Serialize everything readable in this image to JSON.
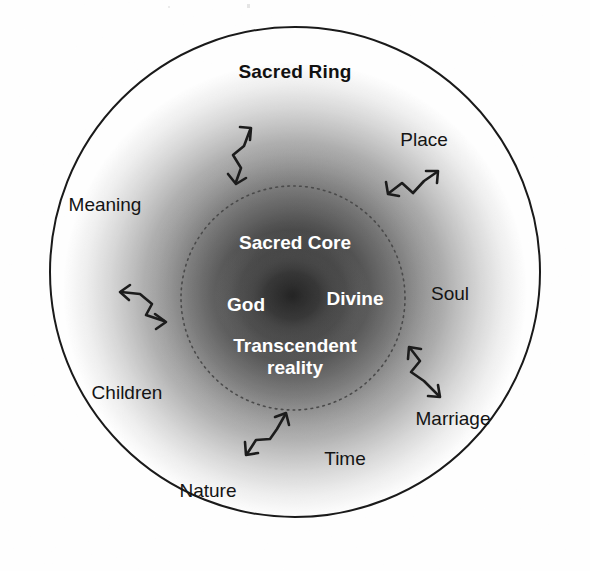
{
  "figure": {
    "type": "concentric-circle-diagram",
    "background_color": "#ffffff",
    "outer_circle": {
      "label": "Sacred Ring",
      "stroke_color": "#1a1a1a",
      "center": [
        295,
        272
      ],
      "radius": 245,
      "style": "solid"
    },
    "inner_circle": {
      "label": "Sacred Core",
      "stroke_color": "#555555",
      "center": [
        293,
        298
      ],
      "radius": 112,
      "style": "dotted"
    },
    "gradient": {
      "description": "radial dark-to-light halo",
      "center_color": "#101010",
      "edge_color": "#ffffff"
    }
  },
  "core": {
    "title": "Sacred Core",
    "terms": [
      {
        "text": "God",
        "x": 246,
        "y": 305
      },
      {
        "text": "Divine",
        "x": 355,
        "y": 299
      },
      {
        "text": "Transcendent",
        "x": 295,
        "y": 346
      },
      {
        "text": "reality",
        "x": 295,
        "y": 368
      }
    ]
  },
  "ring": {
    "title": "Sacred Ring",
    "title_x": 295,
    "title_y": 72,
    "labels": [
      {
        "text": "Place",
        "x": 424,
        "y": 140
      },
      {
        "text": "Meaning",
        "x": 105,
        "y": 205
      },
      {
        "text": "Soul",
        "x": 450,
        "y": 294
      },
      {
        "text": "Children",
        "x": 127,
        "y": 393
      },
      {
        "text": "Marriage",
        "x": 453,
        "y": 419
      },
      {
        "text": "Time",
        "x": 345,
        "y": 459
      },
      {
        "text": "Nature",
        "x": 208,
        "y": 491
      }
    ]
  },
  "connectors": {
    "name": "double-headed-zigzag-arrow",
    "count": 5,
    "color": "#1c1c1c",
    "items": [
      {
        "name": "arrow-top",
        "orientation": "vertical"
      },
      {
        "name": "arrow-upper-right",
        "orientation": "diagonal"
      },
      {
        "name": "arrow-left",
        "orientation": "horizontal"
      },
      {
        "name": "arrow-lower-right",
        "orientation": "vertical"
      },
      {
        "name": "arrow-bottom",
        "orientation": "diagonal"
      }
    ]
  }
}
